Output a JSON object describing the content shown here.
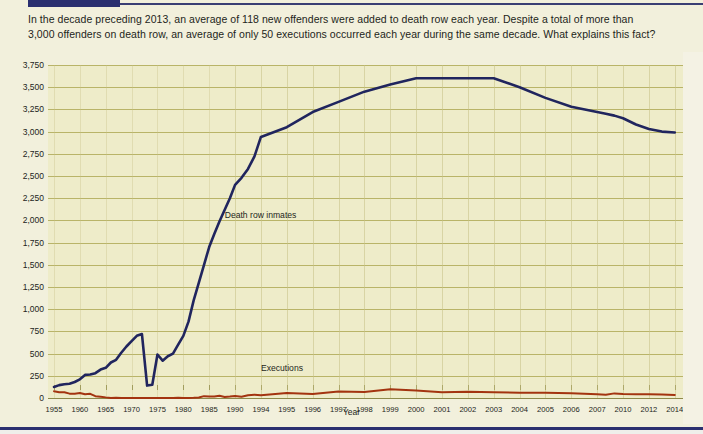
{
  "intro": {
    "line1": "In the decade preceding 2013, an average of 118 new offenders were added to death row each year. Despite a total of more than",
    "line2": "3,000 offenders on death row, an average of only 50 executions occurred each year during the same decade. What explains this fact?"
  },
  "colors": {
    "page_background": "#f2f0dc",
    "plot_background": "#eeecc9",
    "gridline": "#b9b468",
    "inmates_line": "#20255e",
    "executions_line": "#a33410",
    "navy_bar": "#2b3070",
    "text": "#231f20"
  },
  "chart_data": {
    "type": "line",
    "title": "",
    "xlabel": "Year",
    "ylabel": "",
    "ylim": [
      0,
      3750
    ],
    "grid": true,
    "legend_position": "inline-annotation",
    "ytick_labels": [
      "3,750",
      "3,500",
      "3,250",
      "3,000",
      "2,750",
      "2,500",
      "2,250",
      "2,000",
      "1,750",
      "1,500",
      "1,250",
      "1,000",
      "750",
      "500",
      "250",
      "0"
    ],
    "ytick_values": [
      3750,
      3500,
      3250,
      3000,
      2750,
      2500,
      2250,
      2000,
      1750,
      1500,
      1250,
      1000,
      750,
      500,
      250,
      0
    ],
    "xtick_labels": [
      "1955",
      "1960",
      "1965",
      "1970",
      "1975",
      "1980",
      "1985",
      "1990",
      "1994",
      "1995",
      "1996",
      "1997",
      "1998",
      "1999",
      "2000",
      "2001",
      "2002",
      "2003",
      "2004",
      "2005",
      "2006",
      "2007",
      "2010",
      "2012",
      "2014"
    ],
    "xtick_values": [
      1955,
      1960,
      1965,
      1970,
      1975,
      1980,
      1985,
      1990,
      1994,
      1995,
      1996,
      1997,
      1998,
      1999,
      2000,
      2001,
      2002,
      2003,
      2004,
      2005,
      2006,
      2007,
      2010,
      2012,
      2014
    ],
    "x": [
      1955,
      1956,
      1957,
      1958,
      1959,
      1960,
      1961,
      1962,
      1963,
      1964,
      1965,
      1966,
      1967,
      1968,
      1969,
      1970,
      1971,
      1972,
      1973,
      1974,
      1975,
      1976,
      1977,
      1978,
      1979,
      1980,
      1981,
      1982,
      1983,
      1984,
      1985,
      1986,
      1987,
      1988,
      1989,
      1990,
      1991,
      1992,
      1993,
      1994,
      1995,
      1996,
      1997,
      1998,
      1999,
      2000,
      2001,
      2002,
      2003,
      2004,
      2005,
      2006,
      2007,
      2008,
      2009,
      2010,
      2011,
      2012,
      2013,
      2014
    ],
    "series": [
      {
        "name": "Death row inmates",
        "color": "#20255e",
        "values": [
          125,
          145,
          155,
          160,
          180,
          210,
          260,
          265,
          280,
          320,
          340,
          400,
          430,
          510,
          580,
          640,
          700,
          720,
          140,
          150,
          490,
          420,
          470,
          500,
          600,
          700,
          860,
          1100,
          1300,
          1500,
          1700,
          1850,
          1990,
          2120,
          2250,
          2400,
          2480,
          2580,
          2720,
          2940,
          3050,
          3220,
          3335,
          3450,
          3530,
          3600,
          3600,
          3600,
          3600,
          3500,
          3380,
          3280,
          3220,
          3200,
          3180,
          3150,
          3080,
          3030,
          3000,
          2990
        ]
      },
      {
        "name": "Executions",
        "color": "#a33410",
        "values": [
          76,
          65,
          65,
          49,
          49,
          56,
          42,
          47,
          21,
          15,
          7,
          1,
          2,
          0,
          0,
          0,
          0,
          0,
          0,
          0,
          0,
          0,
          1,
          0,
          2,
          0,
          1,
          2,
          5,
          21,
          18,
          18,
          25,
          11,
          16,
          23,
          14,
          31,
          38,
          31,
          56,
          45,
          74,
          68,
          98,
          85,
          66,
          71,
          65,
          59,
          60,
          53,
          42,
          37,
          52,
          46,
          43,
          43,
          39,
          35
        ]
      }
    ],
    "annotations": [
      {
        "text": "Death row inmates",
        "x": 1988,
        "y": 2050
      },
      {
        "text": "Executions",
        "x": 1994,
        "y": 330
      }
    ]
  }
}
